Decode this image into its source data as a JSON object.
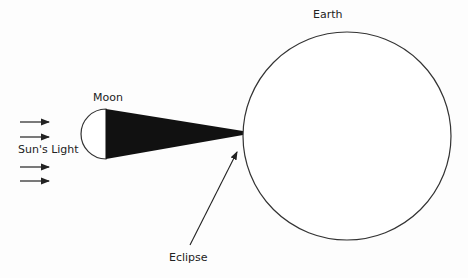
{
  "diagram": {
    "labels": {
      "earth": "Earth",
      "moon": "Moon",
      "sun_light": "Sun's Light",
      "eclipse": "Eclipse"
    },
    "colors": {
      "stroke": "#333333",
      "shadow": "#111111",
      "background": "#fdfdfd"
    }
  }
}
